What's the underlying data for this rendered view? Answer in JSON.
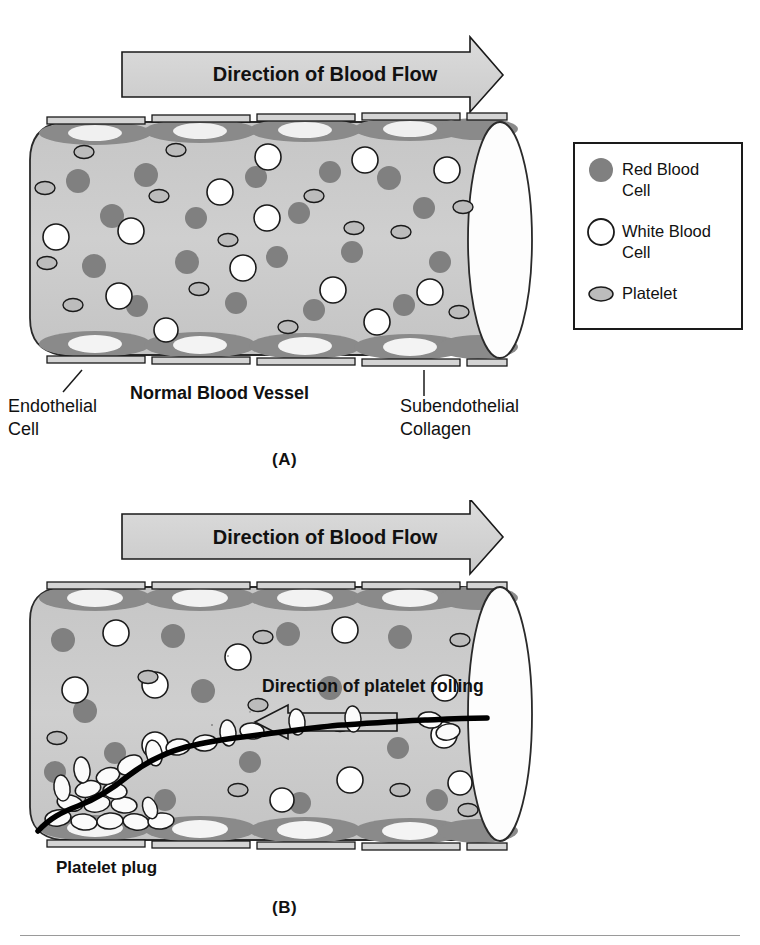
{
  "figure": {
    "bottom_rule": true,
    "panels": [
      {
        "id": "A",
        "label": "(A)",
        "flow_arrow_label": "Direction of Blood Flow",
        "vessel_caption": "Normal Blood Vessel",
        "callouts": [
          {
            "name": "endothelial-cell",
            "line1": "Endothelial",
            "line2": "Cell"
          },
          {
            "name": "subendothelial-collagen",
            "line1": "Subendothelial",
            "line2": "Collagen"
          }
        ]
      },
      {
        "id": "B",
        "label": "(B)",
        "flow_arrow_label": "Direction of Blood Flow",
        "rolling_arrow_label": "Direction of platelet rolling",
        "plug_label": "Platelet plug"
      }
    ]
  },
  "legend": {
    "title": "",
    "items": [
      {
        "symbol": "filled-gray-circle",
        "line1": "Red Blood",
        "line2": "Cell",
        "color": "#808080"
      },
      {
        "symbol": "open-white-circle",
        "line1": "White Blood",
        "line2": "Cell",
        "color": "#ffffff"
      },
      {
        "symbol": "small-gray-ellipse",
        "line1": "Platelet",
        "line2": "",
        "color": "#b4b4b4"
      }
    ]
  },
  "colors": {
    "lumen": "#c9c9c9",
    "endothelium": "#8a8a8a",
    "nucleus": "#f2f2f2",
    "collagen": "#d2d2d2",
    "rbc": "#808080",
    "wbc": "#ffffff",
    "platelet": "#b9b9b9",
    "arrow_fill": "#d0d0d0",
    "outline": "#1a1a1a",
    "plug_line": "#000000"
  },
  "icons": {
    "flow_arrow": "right-arrow-icon",
    "rolling_arrow": "left-arrow-icon"
  }
}
